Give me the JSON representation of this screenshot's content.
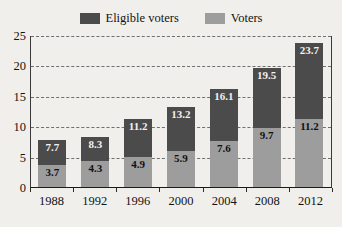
{
  "chart_data": {
    "type": "bar",
    "stacked": true,
    "title": "",
    "xlabel": "",
    "ylabel": "",
    "categories": [
      "1988",
      "1992",
      "1996",
      "2000",
      "2004",
      "2008",
      "2012"
    ],
    "series": [
      {
        "name": "Voters",
        "color": "#9d9d9d",
        "values": [
          3.7,
          4.3,
          4.9,
          5.9,
          7.6,
          9.7,
          11.2
        ],
        "labels": [
          "3.7",
          "4.3",
          "4.9",
          "5.9",
          "7.6",
          "9.7",
          "11.2"
        ]
      },
      {
        "name": "Eligible voters",
        "color": "#4b4b4b",
        "values": [
          7.7,
          8.3,
          11.2,
          13.2,
          16.1,
          19.5,
          23.7
        ],
        "labels": [
          "7.7",
          "8.3",
          "11.2",
          "13.2",
          "16.1",
          "19.5",
          "23.7"
        ]
      }
    ],
    "ylim": [
      0,
      25
    ],
    "yticks": [
      0,
      5,
      10,
      15,
      20,
      25
    ],
    "ytick_labels": [
      "0",
      "5",
      "10",
      "15",
      "20",
      "25"
    ],
    "grid": true,
    "grid_style": "dashed",
    "legend_position": "top-center"
  },
  "legend": {
    "entries": [
      {
        "label": "Eligible voters",
        "color": "#4b4b4b"
      },
      {
        "label": "Voters",
        "color": "#9d9d9d"
      }
    ]
  },
  "colors": {
    "background": "#f1efec",
    "eligible_voters": "#4b4b4b",
    "voters": "#9d9d9d",
    "axis": "#1a1a1a",
    "gridline": "#6f6f6f",
    "text": "#131313"
  }
}
